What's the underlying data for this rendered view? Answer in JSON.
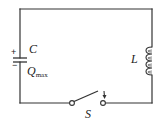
{
  "diagram": {
    "type": "LC circuit",
    "components": {
      "capacitor": {
        "label": "C",
        "charge_label_main": "Q",
        "charge_label_sub": "max",
        "positive_sign": "+",
        "negative_sign": "−"
      },
      "inductor": {
        "label": "L",
        "coil_turns": 4
      },
      "switch": {
        "label": "S",
        "state": "open"
      }
    },
    "colors": {
      "wire": "#333333",
      "background": "#ffffff"
    }
  }
}
